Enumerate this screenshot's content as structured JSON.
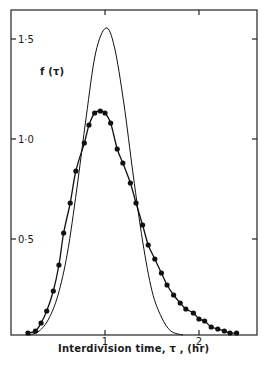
{
  "chart_data": {
    "type": "line",
    "title": "",
    "xlabel": "Interdivision time, τ , (hr)",
    "ylabel": "f (τ)",
    "xlim": [
      0,
      2.62
    ],
    "ylim": [
      0,
      1.62
    ],
    "x_ticks": [
      1,
      2
    ],
    "x_tick_labels": [
      "1",
      "2"
    ],
    "y_ticks": [
      0.5,
      1.0,
      1.5
    ],
    "y_tick_labels": [
      "0·5",
      "1·0",
      "1·5"
    ],
    "grid": false,
    "legend": null,
    "series": [
      {
        "name": "observed (dots)",
        "style": "line-with-filled-circle-markers",
        "color": "#111111",
        "x": [
          0.18,
          0.26,
          0.32,
          0.38,
          0.45,
          0.51,
          0.56,
          0.63,
          0.69,
          0.78,
          0.83,
          0.89,
          0.95,
          1.0,
          1.06,
          1.13,
          1.19,
          1.27,
          1.33,
          1.4,
          1.46,
          1.53,
          1.6,
          1.66,
          1.73,
          1.8,
          1.86,
          1.94,
          2.0,
          2.06,
          2.13,
          2.2,
          2.27,
          2.33,
          2.4
        ],
        "y": [
          0.03,
          0.04,
          0.08,
          0.14,
          0.24,
          0.37,
          0.53,
          0.68,
          0.84,
          0.98,
          1.07,
          1.13,
          1.14,
          1.13,
          1.08,
          0.95,
          0.88,
          0.78,
          0.68,
          0.57,
          0.47,
          0.4,
          0.33,
          0.27,
          0.22,
          0.18,
          0.15,
          0.13,
          0.1,
          0.09,
          0.06,
          0.05,
          0.04,
          0.03,
          0.03
        ]
      },
      {
        "name": "theoretical (solid)",
        "style": "line",
        "color": "#111111",
        "x": [
          0.2,
          0.3,
          0.4,
          0.5,
          0.6,
          0.7,
          0.8,
          0.9,
          1.01,
          1.1,
          1.2,
          1.3,
          1.4,
          1.5,
          1.6,
          1.7,
          1.83
        ],
        "y": [
          0.01,
          0.04,
          0.1,
          0.22,
          0.43,
          0.75,
          1.11,
          1.43,
          1.555,
          1.46,
          1.18,
          0.82,
          0.49,
          0.24,
          0.11,
          0.04,
          0.0
        ]
      }
    ]
  }
}
